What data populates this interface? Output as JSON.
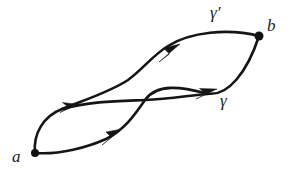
{
  "figure": {
    "type": "path-homotopy-diagram",
    "background_color": "#ffffff",
    "stroke_color": "#151515"
  },
  "labels": {
    "start_point": "a",
    "end_point": "b",
    "path_lower": "γ",
    "path_upper": "γ′"
  },
  "points": [
    {
      "name": "a",
      "label": "a",
      "x": 35,
      "y": 153
    },
    {
      "name": "b",
      "label": "b",
      "x": 259,
      "y": 36
    },
    {
      "name": "crossing",
      "label": "",
      "x": 145,
      "y": 100
    }
  ],
  "curves": [
    {
      "name": "gamma",
      "label": "γ",
      "from": "a",
      "to": "b",
      "arrow_count": 2,
      "description": "lower-left bulge then upper-right bulge"
    },
    {
      "name": "gamma-prime",
      "label": "γ′",
      "from": "a",
      "to": "b",
      "arrow_count": 2,
      "description": "upper-left bulge then steep rise to upper lens"
    }
  ],
  "arrows": [
    {
      "name": "arrow-upper-left",
      "x": 70,
      "y": 107
    },
    {
      "name": "arrow-lower-left",
      "x": 113,
      "y": 137
    },
    {
      "name": "arrow-upper-right",
      "x": 171,
      "y": 53
    },
    {
      "name": "arrow-lower-right",
      "x": 208,
      "y": 94
    }
  ]
}
